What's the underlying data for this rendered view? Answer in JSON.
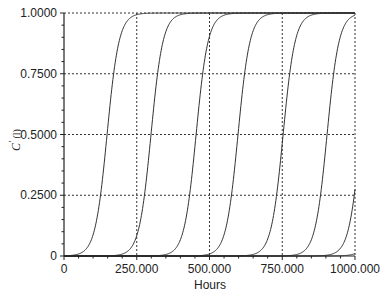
{
  "chart_data": {
    "type": "line",
    "title": "",
    "xlabel": "Hours",
    "ylabel": "C' (l)",
    "xlim": [
      0,
      1000
    ],
    "ylim": [
      0,
      1
    ],
    "x_ticks": [
      0,
      250,
      500,
      750,
      1000
    ],
    "x_tick_labels": [
      "0",
      "250.000",
      "500.000",
      "750.000",
      "1000.000"
    ],
    "x_minor_tick_step": 50,
    "y_ticks": [
      0,
      0.25,
      0.5,
      0.75,
      1.0
    ],
    "y_tick_labels": [
      "0",
      "0.2500",
      "0.5000",
      "0.7500",
      "1.0000"
    ],
    "y_minor_tick_step": 0.05,
    "grid": true,
    "grid_style": "dotted",
    "legend": null,
    "series_model": "sigmoid breakthrough curves, C' = 1 / (1 + exp(-k (t - t50)))",
    "steepness_k": 0.0488,
    "series": [
      {
        "name": "curve 1",
        "t50": 148,
        "x": [
          0,
          100,
          125,
          150,
          175,
          200,
          250,
          1000
        ],
        "values": [
          0.0007,
          0.088,
          0.25,
          0.52,
          0.77,
          0.92,
          0.99,
          1.0
        ]
      },
      {
        "name": "curve 2",
        "t50": 299,
        "x": [
          0,
          250,
          275,
          300,
          325,
          350,
          400,
          1000
        ],
        "values": [
          0.0,
          0.084,
          0.24,
          0.51,
          0.77,
          0.92,
          0.99,
          1.0
        ]
      },
      {
        "name": "curve 3",
        "t50": 454,
        "x": [
          0,
          400,
          425,
          450,
          475,
          500,
          550,
          1000
        ],
        "values": [
          0.0,
          0.067,
          0.2,
          0.45,
          0.73,
          0.9,
          0.99,
          1.0
        ]
      },
      {
        "name": "curve 4",
        "t50": 598,
        "x": [
          0,
          550,
          575,
          600,
          625,
          650,
          700,
          1000
        ],
        "values": [
          0.0,
          0.088,
          0.25,
          0.52,
          0.79,
          0.93,
          0.99,
          1.0
        ]
      },
      {
        "name": "curve 5",
        "t50": 753,
        "x": [
          0,
          700,
          725,
          750,
          775,
          800,
          850,
          1000
        ],
        "values": [
          0.0,
          0.069,
          0.2,
          0.46,
          0.74,
          0.91,
          0.99,
          1.0
        ]
      },
      {
        "name": "curve 6",
        "t50": 904,
        "x": [
          0,
          850,
          875,
          900,
          925,
          950,
          1000
        ],
        "values": [
          0.0,
          0.067,
          0.2,
          0.45,
          0.74,
          0.9,
          0.87
        ]
      },
      {
        "name": "curve 7",
        "t50": 1020,
        "x": [
          0,
          900,
          950,
          975,
          1000
        ],
        "values": [
          0.0,
          0.003,
          0.03,
          0.1,
          0.28
        ]
      },
      {
        "name": "curve 8",
        "t50": 1094,
        "x": [
          0,
          950,
          975,
          1000
        ],
        "values": [
          0.0,
          0.001,
          0.003,
          0.01
        ]
      }
    ]
  },
  "axes": {
    "x_title": "Hours",
    "y_title_main": "C",
    "y_title_sup": "'",
    "y_title_rest": " (l)"
  }
}
